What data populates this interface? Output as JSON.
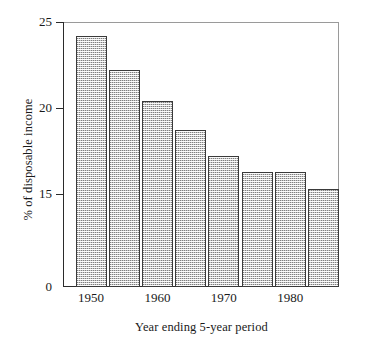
{
  "chart_data": {
    "type": "bar",
    "title": "",
    "xlabel": "Year ending 5-year period",
    "ylabel": "% of disposable income",
    "categories": [
      "1950",
      "1955",
      "1960",
      "1965",
      "1970",
      "1975",
      "1980",
      "1985"
    ],
    "values": [
      24.2,
      22.2,
      20.4,
      18.7,
      17.2,
      16.3,
      16.3,
      15.3
    ],
    "x_tick_labels": [
      "1950",
      "1960",
      "1970",
      "1980"
    ],
    "x_tick_category_indices": [
      0,
      2,
      4,
      6
    ],
    "y_tick_labels": [
      "25",
      "20",
      "15",
      "0"
    ],
    "y_tick_values": [
      25,
      20,
      15,
      0
    ],
    "ylim": [
      0,
      25
    ],
    "y_axis_note": "axis compressed below 15; 0 shown at baseline",
    "grid": false,
    "legend": false,
    "bar_fill_color": "#c9c9c9",
    "bar_edge_color": "#3a3a3a",
    "background_color": "#ffffff"
  },
  "axes": {
    "y_ticks": [
      {
        "label": "25",
        "value": 25
      },
      {
        "label": "20",
        "value": 20
      },
      {
        "label": "15",
        "value": 15
      },
      {
        "label": "0",
        "value": 0
      }
    ],
    "x_ticks": [
      {
        "label": "1950"
      },
      {
        "label": "1960"
      },
      {
        "label": "1970"
      },
      {
        "label": "1980"
      }
    ]
  },
  "bars": [
    {
      "category": "1950",
      "value": 24.2
    },
    {
      "category": "1955",
      "value": 22.2
    },
    {
      "category": "1960",
      "value": 20.4
    },
    {
      "category": "1965",
      "value": 18.7
    },
    {
      "category": "1970",
      "value": 17.2
    },
    {
      "category": "1975",
      "value": 16.3
    },
    {
      "category": "1980",
      "value": 16.3
    },
    {
      "category": "1985",
      "value": 15.3
    }
  ]
}
